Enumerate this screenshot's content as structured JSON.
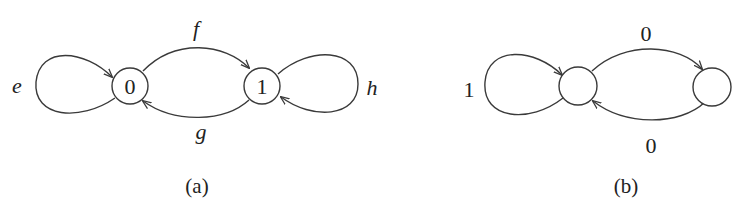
{
  "figure": {
    "panels": [
      {
        "caption": "(a)",
        "nodes": [
          {
            "id": "0",
            "label": "0"
          },
          {
            "id": "1",
            "label": "1"
          }
        ],
        "edges": [
          {
            "from": "0",
            "to": "0",
            "label": "e"
          },
          {
            "from": "0",
            "to": "1",
            "label": "f"
          },
          {
            "from": "1",
            "to": "0",
            "label": "g"
          },
          {
            "from": "1",
            "to": "1",
            "label": "h"
          }
        ]
      },
      {
        "caption": "(b)",
        "nodes": [
          {
            "id": "left",
            "label": ""
          },
          {
            "id": "right",
            "label": ""
          }
        ],
        "edges": [
          {
            "from": "left",
            "to": "left",
            "label": "1"
          },
          {
            "from": "left",
            "to": "right",
            "label": "0"
          },
          {
            "from": "right",
            "to": "left",
            "label": "0"
          }
        ]
      }
    ]
  }
}
